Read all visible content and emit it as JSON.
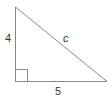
{
  "diagram": {
    "type": "right-triangle",
    "legs": {
      "vertical": "4",
      "horizontal": "5"
    },
    "hypotenuse": "c",
    "right_angle_marker": true,
    "stroke_color": "#888888",
    "label_color": "#333333"
  }
}
